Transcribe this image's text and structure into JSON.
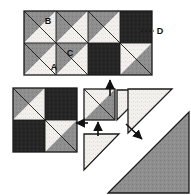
{
  "figure": {
    "labels": [
      {
        "id": "label-a",
        "text": "A",
        "x": 54,
        "y": 70,
        "refers_to": "white (light) triangle of unit"
      },
      {
        "id": "label-b",
        "text": "B",
        "x": 48,
        "y": 24,
        "refers_to": "medium gray triangle of unit"
      },
      {
        "id": "label-c",
        "text": "C",
        "x": 70,
        "y": 56,
        "refers_to": "medium gray triangle of second row unit"
      },
      {
        "id": "label-d",
        "text": "D",
        "x": 160,
        "y": 30,
        "refers_to": "dark (black) square patch"
      }
    ],
    "leader_line": {
      "id": "leader-d",
      "from_x": 141,
      "to_x": 154,
      "y": 31,
      "dashed": true
    }
  },
  "colors": {
    "light": "#f2f0ec",
    "medium_gray": "#8e8e8e",
    "dark": "#262626",
    "outline": "#1a1a1a",
    "background": "#ffffff",
    "arrow": "#111111",
    "text": "#111111"
  },
  "blocks": {
    "finished_block": {
      "name": "finished-block",
      "x": 24,
      "y": 11,
      "cols": 4,
      "rows": 2,
      "cell": 32,
      "units": [
        {
          "row": 0,
          "col": 0,
          "type": "hst",
          "diagonal": "tlbr",
          "upper": "medium_gray",
          "lower": "light"
        },
        {
          "row": 0,
          "col": 1,
          "type": "hst",
          "diagonal": "tlbr",
          "upper": "medium_gray",
          "lower": "light"
        },
        {
          "row": 0,
          "col": 2,
          "type": "hst",
          "diagonal": "tlbr",
          "upper": "medium_gray",
          "lower": "light"
        },
        {
          "row": 0,
          "col": 3,
          "type": "solid",
          "fill": "dark"
        },
        {
          "row": 1,
          "col": 0,
          "type": "hst",
          "diagonal": "tlbr",
          "upper": "medium_gray",
          "lower": "light"
        },
        {
          "row": 1,
          "col": 1,
          "type": "hst",
          "diagonal": "tlbr",
          "upper": "medium_gray",
          "lower": "light"
        },
        {
          "row": 1,
          "col": 2,
          "type": "solid",
          "fill": "dark"
        },
        {
          "row": 1,
          "col": 3,
          "type": "hst",
          "diagonal": "tlbr",
          "upper": "light",
          "lower": "medium_gray"
        }
      ]
    },
    "four_patch": {
      "name": "four-patch-block",
      "x": 13,
      "y": 88,
      "cols": 2,
      "rows": 2,
      "cell": 32,
      "units": [
        {
          "row": 0,
          "col": 0,
          "type": "hst",
          "diagonal": "tlbr",
          "upper": "medium_gray",
          "lower": "light"
        },
        {
          "row": 0,
          "col": 1,
          "type": "solid",
          "fill": "dark"
        },
        {
          "row": 1,
          "col": 0,
          "type": "solid",
          "fill": "dark"
        },
        {
          "row": 1,
          "col": 1,
          "type": "hst",
          "diagonal": "tlbr",
          "upper": "light",
          "lower": "medium_gray"
        }
      ]
    },
    "pieced_unit": {
      "name": "pieced-hst-unit",
      "x": 84,
      "y": 89,
      "size": 31,
      "type": "hst",
      "diagonal": "tlbr",
      "upper": "light",
      "lower": "medium_gray"
    },
    "cut_triangle_right": {
      "name": "cut-triangle-light-upper-right",
      "points": "117,120 117,90 147,90",
      "fill": "light"
    },
    "cut_triangle_lower": {
      "name": "cut-triangle-light-lower",
      "points": "84,170 84,134 119,134",
      "fill": "light"
    },
    "large_square": {
      "name": "stacked-squares-cut",
      "light_triangle": {
        "points": "128,133 172,89 128,89",
        "fill": "light"
      },
      "gray_triangle": {
        "points": "189,193 189,112 108,193",
        "fill": "medium_gray"
      }
    }
  },
  "arrows": [
    {
      "id": "arrow-up-to-finished-block",
      "direction": "up",
      "x1": 110,
      "y1": 96,
      "x2": 110,
      "y2": 80
    },
    {
      "id": "arrow-left-to-four-patch",
      "direction": "left",
      "x1": 88,
      "y1": 123,
      "x2": 76,
      "y2": 123
    },
    {
      "id": "arrow-up-to-pieced-unit",
      "direction": "up",
      "x1": 98,
      "y1": 136,
      "x2": 98,
      "y2": 122
    },
    {
      "id": "arrow-diagonal-cut",
      "direction": "down-right",
      "x1": 126,
      "y1": 124,
      "x2": 142,
      "y2": 139
    }
  ]
}
